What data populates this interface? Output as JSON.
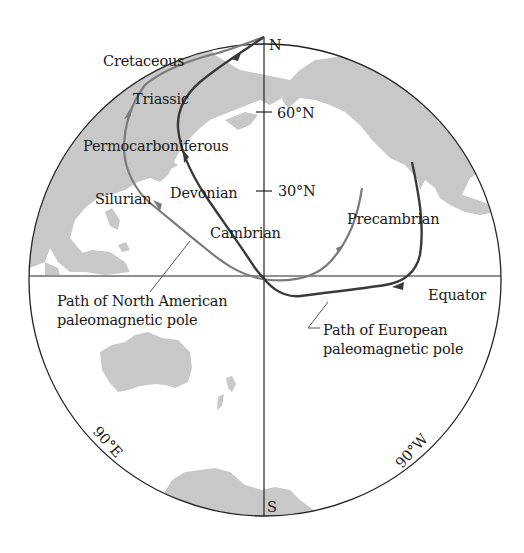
{
  "diagram": {
    "type": "polar-projection-map",
    "colors": {
      "land": "#c8c8c8",
      "outline": "#222222",
      "north_american_path": "#7a7a7a",
      "european_path": "#3a3a3a",
      "text": "#1a1a1a"
    },
    "compass": {
      "north": "N",
      "south": "S",
      "east_meridian": "90°E",
      "west_meridian": "90°W",
      "equator": "Equator"
    },
    "latitude_ticks": [
      {
        "label": "60°N"
      },
      {
        "label": "30°N"
      }
    ],
    "periods": [
      {
        "label": "Cretaceous"
      },
      {
        "label": "Triassic"
      },
      {
        "label": "Permocarboniferous"
      },
      {
        "label": "Devonian"
      },
      {
        "label": "Silurian"
      },
      {
        "label": "Cambrian"
      },
      {
        "label": "Precambrian"
      }
    ],
    "paths": {
      "north_american": {
        "line1": "Path of North American",
        "line2": "paleomagnetic pole"
      },
      "european": {
        "line1": "Path of European",
        "line2": "paleomagnetic pole"
      }
    }
  }
}
